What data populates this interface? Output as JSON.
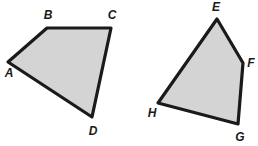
{
  "figure": {
    "background_color": "#ffffff",
    "fill_color": "#d4d4d4",
    "stroke_color": "#1a1a1a",
    "stroke_width": 3.2,
    "label_color": "#1a1a1a",
    "shapes": [
      {
        "id": "shape-abcd",
        "name": "quadrilateral-abcd",
        "kind": "quadrilateral",
        "points": "8,62 47,28 111,28 92,117",
        "vertices": [
          {
            "label": "A",
            "x": 8,
            "y": 62,
            "label_x": 9,
            "label_y": 74
          },
          {
            "label": "B",
            "x": 47,
            "y": 28,
            "label_x": 48,
            "label_y": 16
          },
          {
            "label": "C",
            "x": 111,
            "y": 28,
            "label_x": 112,
            "label_y": 16
          },
          {
            "label": "D",
            "x": 92,
            "y": 117,
            "label_x": 93,
            "label_y": 132
          }
        ]
      },
      {
        "id": "shape-efgh",
        "name": "quadrilateral-efgh",
        "kind": "quadrilateral",
        "points": "217,19 243,63 238,124 158,103",
        "vertices": [
          {
            "label": "E",
            "x": 217,
            "y": 19,
            "label_x": 216,
            "label_y": 8
          },
          {
            "label": "F",
            "x": 243,
            "y": 63,
            "label_x": 251,
            "label_y": 64
          },
          {
            "label": "G",
            "x": 238,
            "y": 124,
            "label_x": 240,
            "label_y": 138
          },
          {
            "label": "H",
            "x": 158,
            "y": 103,
            "label_x": 152,
            "label_y": 114
          }
        ]
      }
    ]
  }
}
